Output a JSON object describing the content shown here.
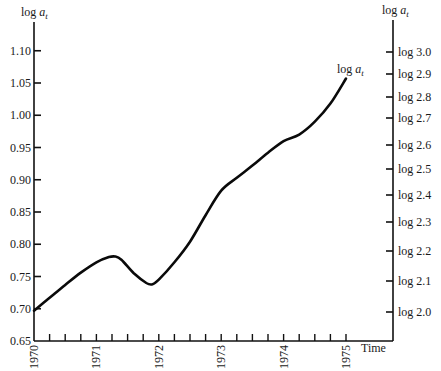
{
  "chart_data": {
    "type": "line",
    "title": "",
    "xlabel": "Time",
    "ylabel": "log a_t",
    "ylabel_right": "log a_t",
    "series_label": "log a_t",
    "x_ticks": [
      "1970",
      "1971",
      "1972",
      "1973",
      "1974",
      "1975"
    ],
    "x_minor_ticks_per_year": 4,
    "xlim": [
      1970,
      1975.75
    ],
    "y_ticks": [
      "0.65",
      "0.70",
      "0.75",
      "0.80",
      "0.85",
      "0.90",
      "0.95",
      "1.00",
      "1.05",
      "1.10"
    ],
    "ylim": [
      0.65,
      1.15
    ],
    "y_right_ticks": [
      "log 2.0",
      "log 2.1",
      "log 2.2",
      "log 2.3",
      "log 2.4",
      "log 2.5",
      "log 2.6",
      "log 2.7",
      "log 2.8",
      "log 2.9",
      "log 3.0"
    ],
    "grid": false,
    "legend": "none",
    "series": [
      {
        "name": "log a_t",
        "x": [
          1970.0,
          1970.25,
          1970.5,
          1970.75,
          1971.0,
          1971.2,
          1971.3,
          1971.4,
          1971.6,
          1971.8,
          1971.9,
          1972.0,
          1972.25,
          1972.5,
          1972.75,
          1973.0,
          1973.25,
          1973.5,
          1973.75,
          1974.0,
          1974.25,
          1974.5,
          1974.75,
          1975.0
        ],
        "values": [
          0.697,
          0.717,
          0.737,
          0.756,
          0.772,
          0.78,
          0.781,
          0.776,
          0.755,
          0.74,
          0.738,
          0.745,
          0.772,
          0.804,
          0.845,
          0.883,
          0.903,
          0.922,
          0.942,
          0.96,
          0.97,
          0.99,
          1.018,
          1.057
        ]
      }
    ]
  },
  "labels": {
    "left_axis_title_main": "log ",
    "left_axis_title_var": "a",
    "left_axis_title_sub": "t",
    "right_axis_title_main": "log ",
    "right_axis_title_var": "a",
    "right_axis_title_sub": "t",
    "curve_label_main": "log ",
    "curve_label_var": "a",
    "curve_label_sub": "t",
    "x_axis_title": "Time"
  }
}
